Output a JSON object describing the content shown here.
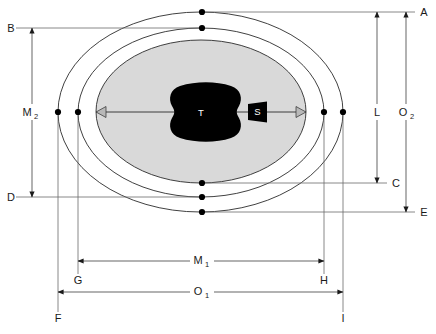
{
  "figure": {
    "background_color": "#ffffff",
    "line_color": "#1a1a1a",
    "fill_shaded": "#d9d9d9",
    "fill_solid": "#000000",
    "fill_open": "#ffffff"
  },
  "shapes": {
    "outer_capsule_label": "outer-boundary-ellipse",
    "secondary_capsule_label": "secondary-boundary-ellipse",
    "shaded_region_label": "shaded-core-ellipse",
    "mass_label": "T",
    "satellite_label": "S"
  },
  "reference_lines": [
    {
      "id": "A",
      "label": "A",
      "orientation": "horizontal",
      "y": 12
    },
    {
      "id": "B",
      "label": "B",
      "orientation": "horizontal",
      "y": 28
    },
    {
      "id": "C",
      "label": "C",
      "orientation": "horizontal",
      "y": 183
    },
    {
      "id": "D",
      "label": "D",
      "orientation": "horizontal",
      "y": 197
    },
    {
      "id": "E",
      "label": "E",
      "orientation": "horizontal",
      "y": 212
    },
    {
      "id": "F",
      "label": "F",
      "orientation": "vertical",
      "x": 58
    },
    {
      "id": "G",
      "label": "G",
      "orientation": "vertical",
      "x": 78
    },
    {
      "id": "H",
      "label": "H",
      "orientation": "vertical",
      "x": 324
    },
    {
      "id": "I",
      "label": "I",
      "orientation": "vertical",
      "x": 343
    }
  ],
  "dimensions": [
    {
      "id": "L",
      "base": "L",
      "sub": "",
      "orientation": "vertical",
      "from": "A",
      "to": "C",
      "label_x": 377,
      "label_y": 112
    },
    {
      "id": "O2",
      "base": "O",
      "sub": "2",
      "orientation": "vertical",
      "from": "A",
      "to": "E",
      "label_x": 406,
      "label_y": 112
    },
    {
      "id": "M2",
      "base": "M",
      "sub": "2",
      "orientation": "vertical",
      "from": "B",
      "to": "D",
      "label_x": 30,
      "label_y": 112
    },
    {
      "id": "M1",
      "base": "M",
      "sub": "1",
      "orientation": "horizontal",
      "from": "G",
      "to": "H",
      "label_x": 201,
      "label_y": 258
    },
    {
      "id": "O1",
      "base": "O",
      "sub": "1",
      "orientation": "horizontal",
      "from": "F",
      "to": "I",
      "label_x": 201,
      "label_y": 295
    }
  ],
  "edge_labels": {
    "A": "A",
    "B": "B",
    "C": "C",
    "D": "D",
    "E": "E",
    "F": "F",
    "G": "G",
    "H": "H",
    "I": "I"
  },
  "interior_labels": {
    "mass": "T",
    "satellite": "S"
  },
  "node_markers": [
    {
      "name": "marker-A-top",
      "x": 202,
      "y": 12
    },
    {
      "name": "marker-B-top",
      "x": 202,
      "y": 28
    },
    {
      "name": "marker-C-bottom",
      "x": 202,
      "y": 183
    },
    {
      "name": "marker-D-bottom",
      "x": 202,
      "y": 197
    },
    {
      "name": "marker-E-bottom",
      "x": 202,
      "y": 212
    },
    {
      "name": "marker-F-left",
      "x": 58,
      "y": 112
    },
    {
      "name": "marker-G-left",
      "x": 78,
      "y": 112
    },
    {
      "name": "marker-H-right",
      "x": 324,
      "y": 112
    },
    {
      "name": "marker-I-right",
      "x": 343,
      "y": 112
    }
  ]
}
